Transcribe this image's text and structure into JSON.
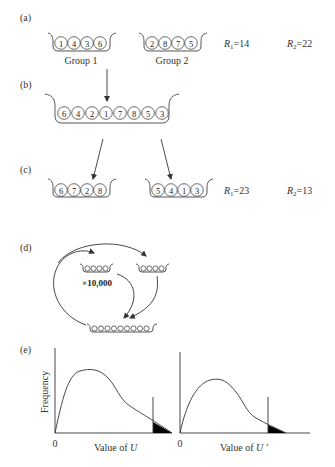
{
  "panels": {
    "a": {
      "label": "(a)",
      "group1": {
        "label": "Group 1",
        "balls": [
          "1",
          "4",
          "3",
          "6"
        ]
      },
      "group2": {
        "label": "Group 2",
        "balls": [
          "2",
          "8",
          "7",
          "5"
        ]
      },
      "r1": {
        "sym": "R",
        "sub": "1",
        "val": "=14"
      },
      "r2": {
        "sym": "R",
        "sub": "2",
        "val": "=22"
      }
    },
    "b": {
      "label": "(b)",
      "pooled": {
        "balls": [
          "6",
          "4",
          "2",
          "1",
          "7",
          "8",
          "5",
          "3"
        ]
      }
    },
    "c": {
      "label": "(c)",
      "group1": {
        "balls": [
          "6",
          "7",
          "2",
          "8"
        ]
      },
      "group2": {
        "balls": [
          "5",
          "4",
          "1",
          "3"
        ]
      },
      "r1": {
        "sym": "R",
        "sub": "1",
        "val": "=23"
      },
      "r2": {
        "sym": "R",
        "sub": "2",
        "val": "=13"
      }
    },
    "d": {
      "label": "(d)",
      "repeat_label": "×10,000"
    },
    "e": {
      "label": "(e)",
      "ylabel": "Frequency",
      "plot1": {
        "origin": "0",
        "xlabel_prefix": "Value of ",
        "xlabel_var": "U"
      },
      "plot2": {
        "origin": "0",
        "xlabel_prefix": "Value of ",
        "xlabel_var": "U ′"
      }
    }
  },
  "colors": {
    "ink": "#333333",
    "background": "#ffffff",
    "tail_fill": "#000000"
  }
}
